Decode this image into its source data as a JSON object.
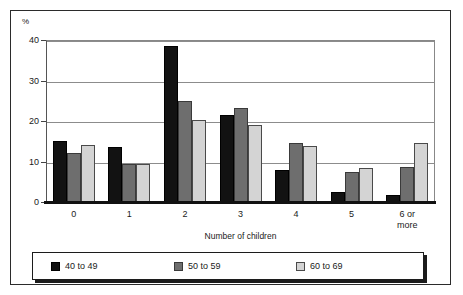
{
  "chart_data": {
    "type": "bar",
    "title": "",
    "subtitle": "",
    "xlabel": "Number of children",
    "ylabel": "",
    "y_unit_label": "%",
    "categories": [
      "0",
      "1",
      "2",
      "3",
      "4",
      "5",
      "6 or\nmore"
    ],
    "category_labels_multiline": [
      [
        "0"
      ],
      [
        "1"
      ],
      [
        "2"
      ],
      [
        "3"
      ],
      [
        "4"
      ],
      [
        "5"
      ],
      [
        "6 or",
        "more"
      ]
    ],
    "series": [
      {
        "name": "40 to 49",
        "color": "#121212",
        "values": [
          15.0,
          13.7,
          38.5,
          21.5,
          7.8,
          2.5,
          1.7
        ]
      },
      {
        "name": "50 to 59",
        "color": "#6e6e6e",
        "values": [
          12.1,
          9.3,
          24.9,
          23.3,
          14.6,
          7.4,
          8.7
        ]
      },
      {
        "name": "60 to 69",
        "color": "#d4d4d4",
        "values": [
          14.2,
          9.5,
          20.3,
          19.0,
          13.9,
          8.4,
          14.6
        ]
      }
    ],
    "ylim": [
      0,
      40
    ],
    "yticks": [
      0,
      10,
      20,
      30,
      40
    ],
    "ytick_labels": [
      "0",
      "10",
      "20",
      "30",
      "40"
    ],
    "grid": true,
    "grid_axis": "y",
    "legend_position": "bottom",
    "legend_entries": [
      "40 to 49",
      "50 to 59",
      "60 to 69"
    ]
  }
}
